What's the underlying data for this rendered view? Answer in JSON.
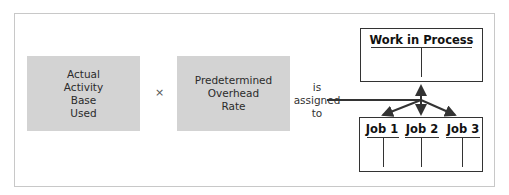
{
  "diagram": {
    "left_box": {
      "lines": [
        "Actual",
        "Activity",
        "Base",
        "Used"
      ]
    },
    "operator": "×",
    "right_box": {
      "lines": [
        "Predetermined",
        "Overhead",
        "Rate"
      ]
    },
    "connector_label": {
      "lines": [
        "is",
        "assigned",
        "to"
      ]
    },
    "account": {
      "title": "Work in Process"
    },
    "jobs": [
      {
        "title": "Job 1"
      },
      {
        "title": "Job 2"
      },
      {
        "title": "Job 3"
      }
    ],
    "colors": {
      "box_fill": "#d3d3d3",
      "line": "#333333",
      "frame": "#c8c8c8"
    }
  }
}
